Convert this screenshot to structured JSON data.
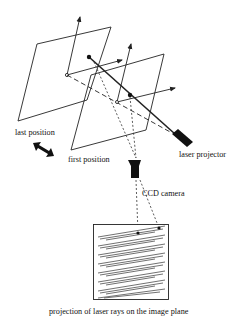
{
  "diagram": {
    "type": "laser-scanning-setup",
    "labels": {
      "last_position": "last position",
      "first_position": "first position",
      "laser_projector": "laser projector",
      "ccd_camera": "CCD camera",
      "caption": "projection of laser rays on the image plane"
    },
    "components": [
      {
        "name": "last-position-plane",
        "label": "last position"
      },
      {
        "name": "first-position-plane",
        "label": "first position"
      },
      {
        "name": "laser-projector",
        "label": "laser projector"
      },
      {
        "name": "ccd-camera",
        "label": "CCD camera"
      },
      {
        "name": "image-plane",
        "label": "projection of laser rays on the image plane"
      }
    ],
    "image_plane": {
      "stripe_rows": 8
    },
    "colors": {
      "line": "#222222",
      "background": "#ffffff"
    }
  }
}
